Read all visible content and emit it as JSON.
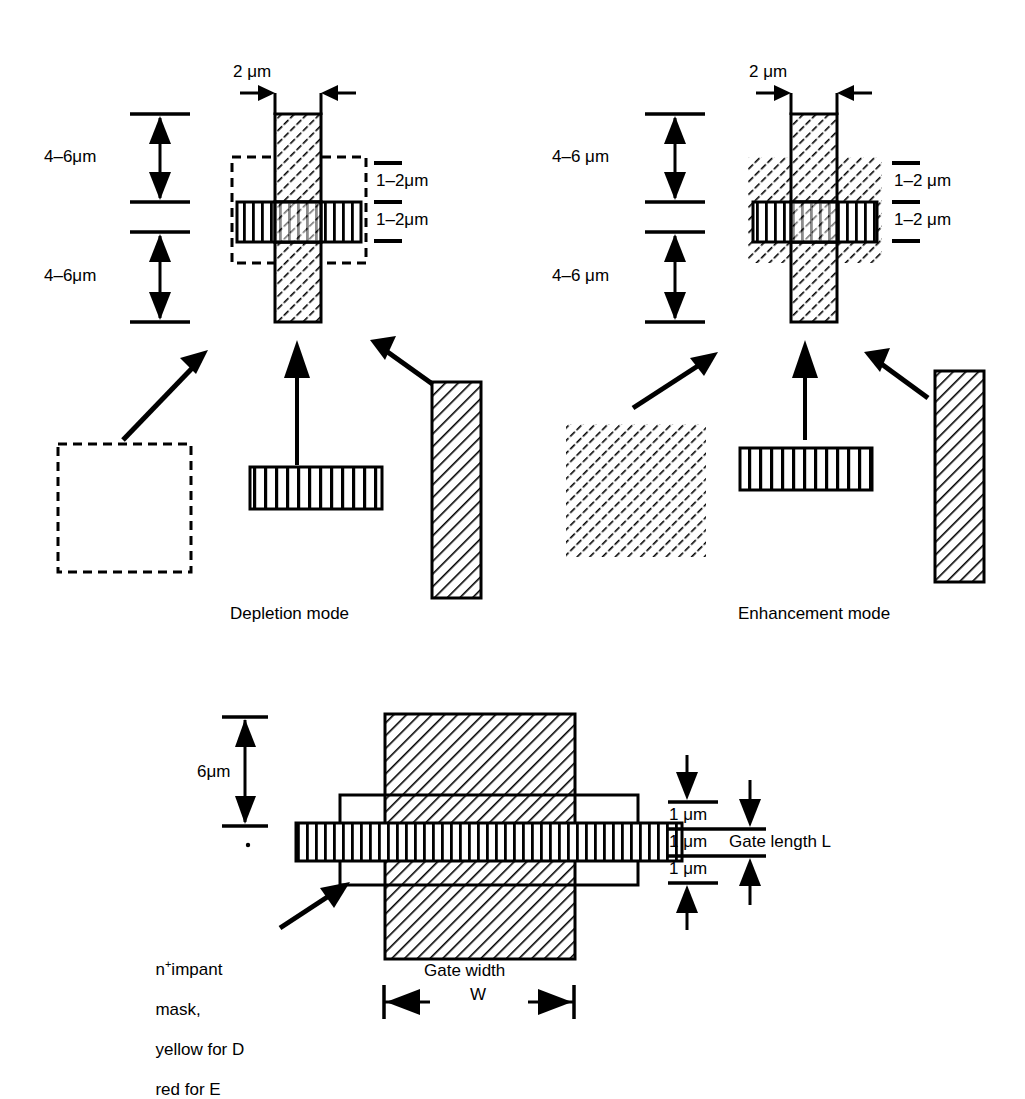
{
  "figure": {
    "title_visible": false,
    "colors": {
      "ink": "#000000",
      "paper": "#ffffff"
    },
    "panels": [
      {
        "id": "depletion",
        "mode_label": "Depletion mode",
        "dimensions": {
          "gate_width_top": "2 μm",
          "left_upper": "4–6μm",
          "left_lower": "4–6μm",
          "right_upper": "1–2μm",
          "right_lower": "1–2μm"
        },
        "legend": [
          {
            "name": "implant-mask-square",
            "fill": "dashed-outline"
          },
          {
            "name": "gate-stripe-bar",
            "fill": "vertical-stripes"
          },
          {
            "name": "gate-metal-bar",
            "fill": "diagonal-hatch"
          }
        ]
      },
      {
        "id": "enhancement",
        "mode_label": "Enhancement mode",
        "dimensions": {
          "gate_width_top": "2 μm",
          "left_upper": "4–6 μm",
          "left_lower": "4–6 μm",
          "right_upper": "1–2 μm",
          "right_lower": "1–2 μm"
        },
        "legend": [
          {
            "name": "implant-mask-square",
            "fill": "diagonal-hatch"
          },
          {
            "name": "gate-stripe-bar",
            "fill": "vertical-stripes"
          },
          {
            "name": "gate-metal-bar",
            "fill": "diagonal-hatch"
          }
        ]
      }
    ],
    "bottom_panel": {
      "id": "plan-view",
      "dimensions": {
        "left_vertical": "6μm",
        "right_top": "1 μm",
        "right_mid": "1 μm",
        "right_bottom": "1 μm",
        "gate_length_label": "Gate length L",
        "gate_width_label_line1": "Gate width",
        "gate_width_label_line2": "W"
      },
      "callout": {
        "text_line1_prefix": "n",
        "text_line1_sup": "+",
        "text_line1_suffix": "impant",
        "text_line2": "mask,",
        "text_line3": "yellow for D",
        "text_line4": "red for E"
      }
    }
  }
}
